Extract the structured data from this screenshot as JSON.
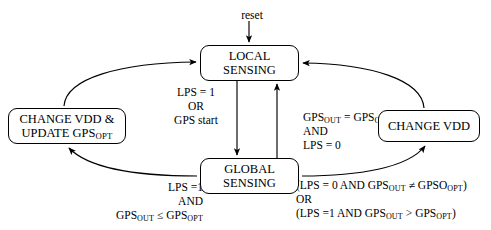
{
  "diagram": {
    "states": [
      {
        "id": "local",
        "line1": "LOCAL",
        "line2": "SENSING"
      },
      {
        "id": "global",
        "line1": "GLOBAL",
        "line2": "SENSING"
      },
      {
        "id": "change_update",
        "line1": "CHANGE VDD &",
        "line2_pre": "UPDATE GPS",
        "line2_sub": "OPT"
      },
      {
        "id": "change_vdd",
        "line1": "CHANGE VDD"
      }
    ],
    "labels": {
      "reset": "reset",
      "local_to_global": {
        "line1": "LPS = 1",
        "line2": "OR",
        "line3": "GPS start"
      },
      "global_to_local": {
        "line1_pre": "GPS",
        "line1_sub1": "OUT",
        "line1_mid": " = GPS",
        "line1_sub2": "OPT",
        "line2": "AND",
        "line3": "LPS = 0"
      },
      "global_to_change_update": {
        "line1": "LPS =1",
        "line2": "AND",
        "line3_pre": "GPS",
        "line3_sub1": "OUT",
        "line3_mid": " ≤ GPS",
        "line3_sub2": "OPT"
      },
      "global_to_change_vdd": {
        "line1_a": "(LPS = 0  AND  GPS",
        "line1_sub1": "OUT",
        "line1_b": " ≠ GPSO",
        "line1_sub2": "OPT",
        "line1_c": ")",
        "line2": "OR",
        "line3_a": "(LPS =1  AND  GPS",
        "line3_sub1": "OUT",
        "line3_b": " > GPS",
        "line3_sub2": "OPT",
        "line3_c": ")"
      }
    },
    "colors": {
      "stroke": "#000000",
      "background": "#ffffff",
      "text": "#000000"
    }
  }
}
